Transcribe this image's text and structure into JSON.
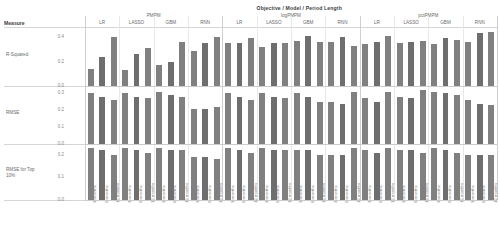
{
  "header": {
    "title": "Objective / Model / Period Length",
    "measure_label": "Measure"
  },
  "axis": {
    "row_labels": [
      "R-Squared",
      "RMSE",
      "RMSE for Top 10%"
    ],
    "ticks": [
      [
        "0.0",
        "0.2",
        "0.4"
      ],
      [
        "0.0",
        "0.1",
        "0.2",
        "0.3"
      ],
      [
        "0.0",
        "0.1",
        "0.2"
      ]
    ],
    "period_labels": [
      "3 months",
      "6 months",
      "12 months"
    ]
  },
  "colors": {
    "bar": "#808080",
    "bar_alt": "#6e6e6e",
    "gridline": "#dedede",
    "text": "#6a6a6a",
    "heading": "#404040"
  },
  "chart_data": {
    "type": "bar",
    "title": "Objective / Model / Period Length",
    "xlabel": "Objective / Model / Period Length",
    "ylabel": "Measure",
    "grid": false,
    "legend": "none",
    "objectives": [
      "PMPM",
      "logPMPM",
      "pctPMPM"
    ],
    "models": [
      "LR",
      "LASSO",
      "GBM",
      "RNN"
    ],
    "categories": [
      "3 months",
      "6 months",
      "12 months"
    ],
    "measures": [
      "R-Squared",
      "RMSE",
      "RMSE for Top 10%"
    ],
    "ylim": [
      [
        0,
        0.45
      ],
      [
        0,
        0.32
      ],
      [
        0,
        0.23
      ]
    ],
    "yticks": [
      [
        0.0,
        0.2,
        0.4
      ],
      [
        0.0,
        0.1,
        0.2,
        0.3
      ],
      [
        0.0,
        0.1,
        0.2
      ]
    ],
    "panels": [
      {
        "measure": "R-Squared",
        "groups": [
          {
            "objective": "PMPM",
            "model": "LR",
            "values": [
              0.14,
              0.24,
              0.4
            ]
          },
          {
            "objective": "PMPM",
            "model": "LASSO",
            "values": [
              0.13,
              0.26,
              0.31
            ]
          },
          {
            "objective": "PMPM",
            "model": "GBM",
            "values": [
              0.17,
              0.2,
              0.36
            ]
          },
          {
            "objective": "PMPM",
            "model": "RNN",
            "values": [
              0.29,
              0.35,
              0.4
            ]
          },
          {
            "objective": "logPMPM",
            "model": "LR",
            "values": [
              0.35,
              0.35,
              0.39
            ]
          },
          {
            "objective": "logPMPM",
            "model": "LASSO",
            "values": [
              0.32,
              0.35,
              0.35
            ]
          },
          {
            "objective": "logPMPM",
            "model": "GBM",
            "values": [
              0.37,
              0.41,
              0.36
            ]
          },
          {
            "objective": "logPMPM",
            "model": "RNN",
            "values": [
              0.36,
              0.4,
              0.33
            ]
          },
          {
            "objective": "pctPMPM",
            "model": "LR",
            "values": [
              0.34,
              0.36,
              0.41
            ]
          },
          {
            "objective": "pctPMPM",
            "model": "LASSO",
            "values": [
              0.35,
              0.36,
              0.37
            ]
          },
          {
            "objective": "pctPMPM",
            "model": "GBM",
            "values": [
              0.34,
              0.39,
              0.38
            ]
          },
          {
            "objective": "pctPMPM",
            "model": "RNN",
            "values": [
              0.36,
              0.43,
              0.44
            ]
          }
        ]
      },
      {
        "measure": "RMSE",
        "groups": [
          {
            "objective": "PMPM",
            "model": "LR",
            "values": [
              0.3,
              0.28,
              0.26
            ]
          },
          {
            "objective": "PMPM",
            "model": "LASSO",
            "values": [
              0.3,
              0.28,
              0.27
            ]
          },
          {
            "objective": "PMPM",
            "model": "GBM",
            "values": [
              0.31,
              0.29,
              0.28
            ]
          },
          {
            "objective": "PMPM",
            "model": "RNN",
            "values": [
              0.21,
              0.21,
              0.22
            ]
          },
          {
            "objective": "logPMPM",
            "model": "LR",
            "values": [
              0.3,
              0.28,
              0.26
            ]
          },
          {
            "objective": "logPMPM",
            "model": "LASSO",
            "values": [
              0.3,
              0.28,
              0.27
            ]
          },
          {
            "objective": "logPMPM",
            "model": "GBM",
            "values": [
              0.3,
              0.28,
              0.25
            ]
          },
          {
            "objective": "logPMPM",
            "model": "RNN",
            "values": [
              0.25,
              0.24,
              0.31
            ]
          },
          {
            "objective": "pctPMPM",
            "model": "LR",
            "values": [
              0.27,
              0.25,
              0.31
            ]
          },
          {
            "objective": "pctPMPM",
            "model": "LASSO",
            "values": [
              0.28,
              0.27,
              0.32
            ]
          },
          {
            "objective": "pctPMPM",
            "model": "GBM",
            "values": [
              0.31,
              0.3,
              0.29
            ]
          },
          {
            "objective": "pctPMPM",
            "model": "RNN",
            "values": [
              0.26,
              0.24,
              0.23
            ]
          }
        ]
      },
      {
        "measure": "RMSE for Top 10%",
        "groups": [
          {
            "objective": "PMPM",
            "model": "LR",
            "values": [
              0.23,
              0.22,
              0.2
            ]
          },
          {
            "objective": "PMPM",
            "model": "LASSO",
            "values": [
              0.23,
              0.22,
              0.21
            ]
          },
          {
            "objective": "PMPM",
            "model": "GBM",
            "values": [
              0.23,
              0.22,
              0.22
            ]
          },
          {
            "objective": "PMPM",
            "model": "RNN",
            "values": [
              0.19,
              0.19,
              0.18
            ]
          },
          {
            "objective": "logPMPM",
            "model": "LR",
            "values": [
              0.23,
              0.22,
              0.21
            ]
          },
          {
            "objective": "logPMPM",
            "model": "LASSO",
            "values": [
              0.23,
              0.22,
              0.22
            ]
          },
          {
            "objective": "logPMPM",
            "model": "GBM",
            "values": [
              0.22,
              0.22,
              0.2
            ]
          },
          {
            "objective": "logPMPM",
            "model": "RNN",
            "values": [
              0.2,
              0.2,
              0.23
            ]
          },
          {
            "objective": "pctPMPM",
            "model": "LR",
            "values": [
              0.22,
              0.21,
              0.23
            ]
          },
          {
            "objective": "pctPMPM",
            "model": "LASSO",
            "values": [
              0.22,
              0.22,
              0.21
            ]
          },
          {
            "objective": "pctPMPM",
            "model": "GBM",
            "values": [
              0.23,
              0.22,
              0.21
            ]
          },
          {
            "objective": "pctPMPM",
            "model": "RNN",
            "values": [
              0.2,
              0.2,
              0.2
            ]
          }
        ]
      }
    ]
  }
}
